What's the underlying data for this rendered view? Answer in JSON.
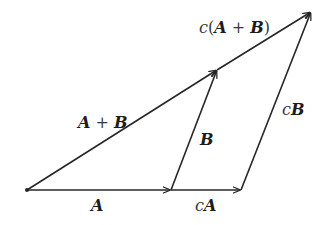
{
  "diagram": {
    "colors": {
      "line": "#262626",
      "text": "#1c1c1c",
      "background": "#ffffff"
    },
    "points": {
      "origin": [
        27,
        190
      ],
      "a_end": [
        171,
        190
      ],
      "ca_end": [
        241,
        190
      ],
      "apb_end": [
        217,
        70
      ],
      "capb_end": [
        311,
        12
      ]
    },
    "labels": {
      "a": {
        "scalar": "",
        "vec": "A"
      },
      "ca": {
        "scalar": "c",
        "vec": "A"
      },
      "b": {
        "scalar": "",
        "vec": "B"
      },
      "cb": {
        "scalar": "c",
        "vec": "B"
      },
      "apb": {
        "vec1": "A",
        "op": " + ",
        "vec2": "B"
      },
      "capb": {
        "scalar": "c",
        "open": "(",
        "vec1": "A",
        "op": " + ",
        "vec2": "B",
        "close": ")"
      }
    },
    "vectors": [
      {
        "name": "A",
        "from": "origin",
        "to": "a_end",
        "arrow": true
      },
      {
        "name": "cA",
        "from": "a_end",
        "to": "ca_end",
        "arrow": true
      },
      {
        "name": "B",
        "from": "a_end",
        "to": "apb_end",
        "arrow": true
      },
      {
        "name": "cB",
        "from": "ca_end",
        "to": "capb_end",
        "arrow": true
      },
      {
        "name": "A+B",
        "from": "origin",
        "to": "apb_end",
        "arrow": true
      },
      {
        "name": "c(A+B)",
        "from": "apb_end",
        "to": "capb_end",
        "arrow": true
      }
    ]
  }
}
